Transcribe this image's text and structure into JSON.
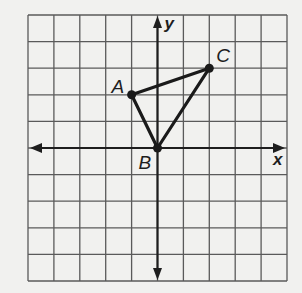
{
  "diagram": {
    "type": "coordinate-plane",
    "grid": {
      "x_min": -5,
      "x_max": 5,
      "y_min": -5,
      "y_max": 5,
      "step": 1
    },
    "axes": {
      "x_label": "x",
      "y_label": "y"
    },
    "points": [
      {
        "id": "A",
        "label": "A",
        "x": -1,
        "y": 2
      },
      {
        "id": "B",
        "label": "B",
        "x": 0,
        "y": 0
      },
      {
        "id": "C",
        "label": "C",
        "x": 2,
        "y": 3
      }
    ],
    "segments": [
      {
        "from": "A",
        "to": "C"
      },
      {
        "from": "A",
        "to": "B"
      },
      {
        "from": "B",
        "to": "C"
      }
    ],
    "colors": {
      "background": "#f1f1ef",
      "grid": "#5a5a5a",
      "ink": "#1a1a1a"
    }
  }
}
